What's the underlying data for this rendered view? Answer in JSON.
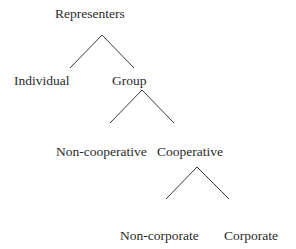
{
  "diagram": {
    "type": "tree",
    "nodes": {
      "root": "Representers",
      "individual": "Individual",
      "group": "Group",
      "non_cooperative": "Non-cooperative",
      "cooperative": "Cooperative",
      "non_corporate": "Non-corporate",
      "corporate": "Corporate"
    },
    "edges": [
      {
        "from": "Representers",
        "to": "Individual"
      },
      {
        "from": "Representers",
        "to": "Group"
      },
      {
        "from": "Group",
        "to": "Non-cooperative"
      },
      {
        "from": "Group",
        "to": "Cooperative"
      },
      {
        "from": "Cooperative",
        "to": "Non-corporate"
      },
      {
        "from": "Cooperative",
        "to": "Corporate"
      }
    ]
  }
}
